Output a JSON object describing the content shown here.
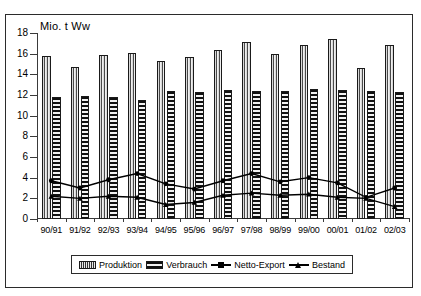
{
  "chart_data": {
    "type": "bar",
    "title": "",
    "ylabel": "Mio. t Ww",
    "xlabel": "",
    "ylim": [
      0,
      18
    ],
    "yticks": [
      0,
      2,
      4,
      6,
      8,
      10,
      12,
      14,
      16,
      18
    ],
    "grid": false,
    "legend_position": "bottom",
    "categories": [
      "90/91",
      "91/92",
      "92/93",
      "93/94",
      "94/95",
      "95/96",
      "96/97",
      "97/98",
      "98/99",
      "99/00",
      "00/01",
      "01/02",
      "02/03"
    ],
    "series": [
      {
        "name": "Produktion",
        "type": "bar",
        "values": [
          15.8,
          14.7,
          15.9,
          16.1,
          15.3,
          15.7,
          16.4,
          17.1,
          16.0,
          16.8,
          17.4,
          14.6,
          16.8
        ]
      },
      {
        "name": "Verbrauch",
        "type": "bar",
        "values": [
          11.8,
          11.9,
          11.8,
          11.5,
          12.4,
          12.3,
          12.5,
          12.4,
          12.4,
          12.6,
          12.5,
          12.4,
          12.3
        ]
      },
      {
        "name": "Netto-Export",
        "type": "line",
        "values": [
          3.7,
          3.0,
          3.8,
          4.4,
          3.4,
          2.9,
          3.7,
          4.4,
          3.6,
          4.0,
          3.5,
          2.1,
          3.0
        ]
      },
      {
        "name": "Bestand",
        "type": "line",
        "values": [
          2.2,
          2.0,
          2.2,
          2.1,
          1.4,
          1.6,
          2.3,
          2.5,
          2.3,
          2.4,
          2.1,
          2.0,
          1.2
        ]
      }
    ]
  },
  "legend": {
    "items": [
      {
        "label": "Produktion",
        "marker": "hatch-vertical-swatch"
      },
      {
        "label": "Verbrauch",
        "marker": "hatch-horizontal-swatch"
      },
      {
        "label": "Netto-Export",
        "marker": "line-circle-marker"
      },
      {
        "label": "Bestand",
        "marker": "line-triangle-marker"
      }
    ]
  },
  "colors": {
    "axis": "#3a3a3a",
    "frame": "#2b2b2b",
    "series_line": "#000000",
    "background": "#ffffff"
  }
}
